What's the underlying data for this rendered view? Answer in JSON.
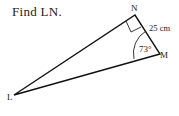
{
  "problem": {
    "prompt": "Find LN."
  },
  "diagram": {
    "vertices": {
      "L": "L",
      "N": "N",
      "M": "M"
    },
    "side_NM_label": "25 cm",
    "angle_M_label": "73°",
    "right_angle_at": "N"
  }
}
